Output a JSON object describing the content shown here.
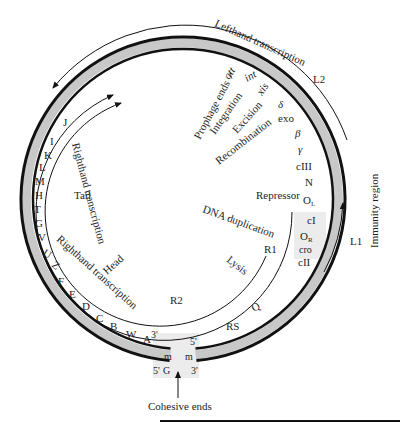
{
  "diagram": {
    "colors": {
      "line": "#111111",
      "ring_fill": "#c8c8c8",
      "shade": "#ececec",
      "text": "#1e1e1e"
    },
    "transcripts": {
      "lefthand": "Lefthand transcription",
      "righthand_outer": "Righthand transcription",
      "righthand_inner": "Righthand transcription",
      "L1": "L1",
      "L2": "L2",
      "R1": "R1",
      "R2": "R2"
    },
    "regions": {
      "immunity": "Immunity region",
      "prophage_ends": "Prophage ends",
      "integration": "Integration",
      "excision": "Excision",
      "recombination": "Recombination",
      "repressor": "Repressor",
      "dna_duplication": "DNA duplication",
      "lysis": "Lysis",
      "head": "Head",
      "tail": "Tail"
    },
    "genes_left": [
      "J",
      "I",
      "K",
      "L",
      "M",
      "H",
      "T",
      "G",
      "V",
      "U",
      "Z",
      "F",
      "E",
      "D",
      "C",
      "B",
      "W",
      "A"
    ],
    "genes_right": {
      "att": "att",
      "int": "int",
      "xis": "xis",
      "delta": "δ",
      "exo": "exo",
      "beta": "β",
      "gamma": "γ",
      "cIII": "cIII",
      "N": "N",
      "OL_main": "O",
      "OL_sub": "L",
      "cI": "cI",
      "OR_main": "O",
      "OR_sub": "R",
      "cro": "cro",
      "cII": "cII",
      "Q": "Q",
      "RS": "RS"
    },
    "cohesive": {
      "label": "Cohesive ends",
      "left_top": "3'",
      "right_top": "5'",
      "left_m": "m",
      "right_m": "m",
      "left_bottom": "5'",
      "G": "G",
      "right_bottom": "3'"
    }
  }
}
